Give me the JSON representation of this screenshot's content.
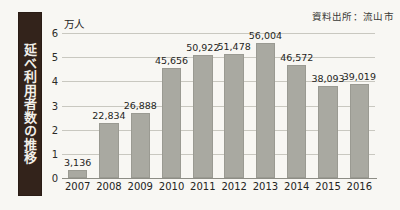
{
  "figure": {
    "side_title": "延べ利用者数の推移",
    "source_note": "資料出所：流山市"
  },
  "chart_data": {
    "type": "bar",
    "title": "延べ利用者数の推移",
    "subtitle": "",
    "xlabel": "",
    "ylabel": "万人",
    "unit_label": "万人",
    "source": "資料出所：流山市",
    "categories": [
      "2007",
      "2008",
      "2009",
      "2010",
      "2011",
      "2012",
      "2013",
      "2014",
      "2015",
      "2016"
    ],
    "values": [
      3136,
      22834,
      26888,
      45656,
      50922,
      51478,
      56004,
      46572,
      38093,
      39019
    ],
    "value_labels": [
      "3,136",
      "22,834",
      "26,888",
      "45,656",
      "50,922",
      "51,478",
      "56,004",
      "46,572",
      "38,093",
      "39,019"
    ],
    "ylim": [
      0,
      6
    ],
    "ytick_labels": [
      "0",
      "1",
      "2",
      "3",
      "4",
      "5",
      "6"
    ],
    "ytick_values": [
      0,
      1,
      2,
      3,
      4,
      5,
      6
    ],
    "y_axis_scale_factor": 10000,
    "grid": true,
    "legend": null,
    "legend_position": "none",
    "series": [
      {
        "name": "延べ利用者数",
        "values": [
          3136,
          22834,
          26888,
          45656,
          50922,
          51478,
          56004,
          46572,
          38093,
          39019
        ]
      }
    ],
    "colors": {
      "bar_fill": "#a9a9a1",
      "bar_edge": "#9a9a92",
      "gridline": "#c9c8c0",
      "background": "#f8f7f3",
      "side_title_bar": "#33231b",
      "side_title_text": "#f2efe9",
      "text": "#232321"
    }
  }
}
